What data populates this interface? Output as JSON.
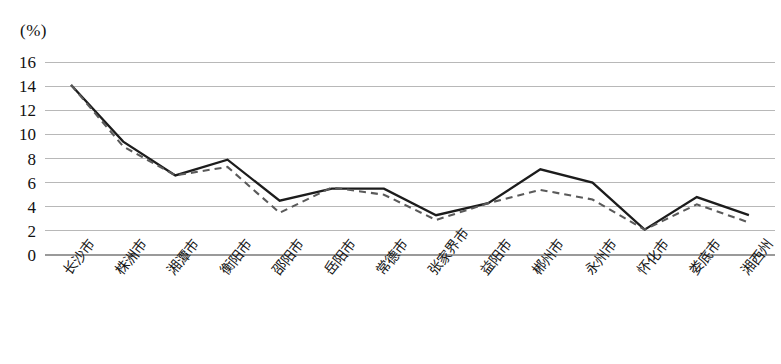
{
  "chart_data": {
    "type": "line",
    "title": "",
    "xlabel": "",
    "ylabel": "(%)",
    "unit_label": "(%)",
    "ylim": [
      0,
      16
    ],
    "ytick_step": 2,
    "yticks": [
      "16",
      "14",
      "12",
      "10",
      "8",
      "6",
      "4",
      "2",
      "0"
    ],
    "grid": true,
    "legend": "none",
    "categories": [
      "长沙市",
      "株洲市",
      "湘潭市",
      "衡阳市",
      "邵阳市",
      "岳阳市",
      "常德市",
      "张家界市",
      "益阳市",
      "郴州市",
      "永州市",
      "怀化市",
      "娄底市",
      "湘西州"
    ],
    "series": [
      {
        "name": "solid-line",
        "style": "solid",
        "color": "#1c1c1c",
        "values": [
          14.1,
          9.4,
          6.6,
          7.9,
          4.5,
          5.5,
          5.5,
          3.3,
          4.3,
          7.1,
          6.0,
          2.1,
          4.8,
          3.3
        ]
      },
      {
        "name": "dashed-line",
        "style": "dashed",
        "color": "#5a5a5a",
        "values": [
          14.1,
          9.0,
          6.6,
          7.3,
          3.5,
          5.6,
          5.0,
          2.9,
          4.3,
          5.4,
          4.6,
          2.1,
          4.2,
          2.7
        ]
      }
    ]
  },
  "plot_geometry": {
    "left": 45,
    "right": 775,
    "top": 62,
    "bottom": 255
  }
}
